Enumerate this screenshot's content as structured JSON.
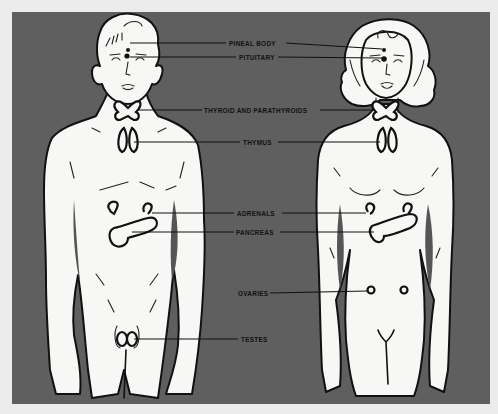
{
  "diagram": {
    "colors": {
      "panel": "#5f5f5f",
      "page": "#ececec",
      "figure_fill": "#f7f7f5",
      "ink": "#111111"
    },
    "figures": [
      {
        "id": "male",
        "label": "Male figure"
      },
      {
        "id": "female",
        "label": "Female figure"
      }
    ],
    "labels": {
      "pineal": "PINEAL BODY",
      "pituitary": "PITUITARY",
      "thyroid": "THYROID AND PARATHYROIDS",
      "thymus": "THYMUS",
      "adrenals": "ADRENALS",
      "pancreas": "PANCREAS",
      "ovaries": "OVARIES",
      "testes": "TESTES"
    }
  }
}
